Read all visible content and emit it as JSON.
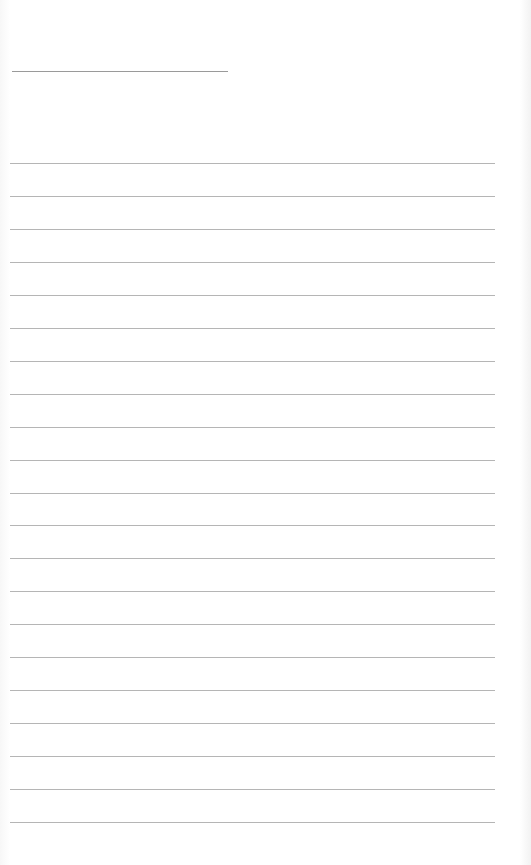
{
  "document": {
    "type": "lined-paper",
    "title_text": "",
    "title_line": {
      "x": 12,
      "y": 71,
      "width": 216
    },
    "rules": {
      "count": 21,
      "start_y": 163,
      "spacing": 32.95,
      "left": 10,
      "width": 485
    },
    "colors": {
      "paper": "#ffffff",
      "rule": "#a8a8a8",
      "title_line": "#9a9a9a"
    }
  }
}
